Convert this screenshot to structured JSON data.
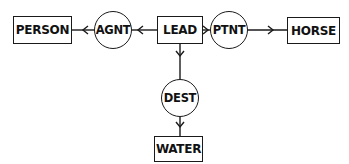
{
  "diagram": {
    "type": "conceptual-graph",
    "concepts": {
      "person": "PERSON",
      "lead": "LEAD",
      "horse": "HORSE",
      "water": "WATER"
    },
    "relations": {
      "agnt": "AGNT",
      "ptnt": "PTNT",
      "dest": "DEST"
    },
    "edges": [
      {
        "from": "LEAD",
        "to": "AGNT"
      },
      {
        "from": "AGNT",
        "to": "PERSON"
      },
      {
        "from": "LEAD",
        "to": "PTNT"
      },
      {
        "from": "PTNT",
        "to": "HORSE"
      },
      {
        "from": "LEAD",
        "to": "DEST"
      },
      {
        "from": "DEST",
        "to": "WATER"
      }
    ],
    "colors": {
      "stroke": "#1a1a1a",
      "background": "#ffffff"
    }
  }
}
